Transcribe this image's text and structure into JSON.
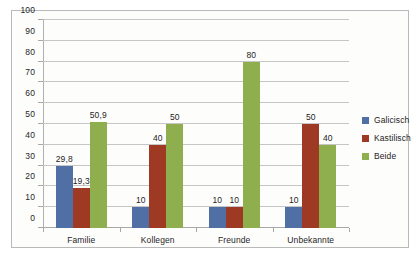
{
  "chart_data": {
    "type": "bar",
    "title": "",
    "subtitle": "",
    "xlabel": "",
    "ylabel": "",
    "ylim": [
      0,
      100
    ],
    "ytick_step": 10,
    "yticks": [
      "100",
      "90",
      "80",
      "70",
      "60",
      "50",
      "40",
      "30",
      "20",
      "10",
      "0"
    ],
    "grid": true,
    "legend_position": "right",
    "decimal_separator": ",",
    "categories": [
      "Familie",
      "Kollegen",
      "Freunde",
      "Unbekannte"
    ],
    "series": [
      {
        "name": "Galicisch",
        "color": "#4F6FA5",
        "values": [
          29.8,
          10,
          10,
          10
        ],
        "labels": [
          "29,8",
          "10",
          "10",
          "10"
        ]
      },
      {
        "name": "Kastilisch",
        "color": "#9E3A23",
        "values": [
          19.3,
          40,
          10,
          50
        ],
        "labels": [
          "19,3",
          "40",
          "10",
          "50"
        ]
      },
      {
        "name": "Beide",
        "color": "#8FAE4E",
        "values": [
          50.9,
          50,
          80,
          40
        ],
        "labels": [
          "50,9",
          "50",
          "80",
          "40"
        ]
      }
    ]
  },
  "legend": {
    "items": [
      {
        "label": "Galicisch",
        "color": "#4F6FA5"
      },
      {
        "label": "Kastilisch",
        "color": "#9E3A23"
      },
      {
        "label": "Beide",
        "color": "#8FAE4E"
      }
    ]
  }
}
